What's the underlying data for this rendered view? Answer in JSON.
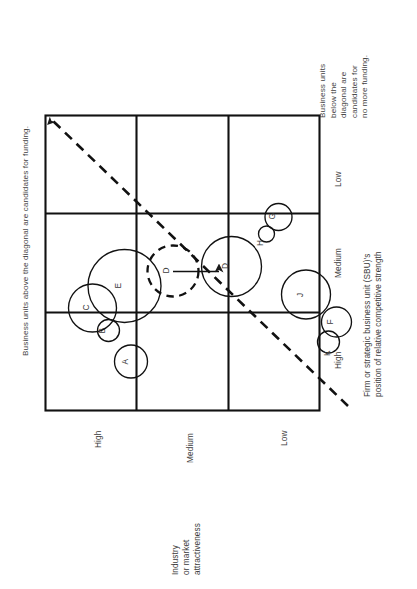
{
  "figure": {
    "type": "ge-mckinsey-matrix",
    "rotation_deg": -90,
    "notes": {
      "above_diagonal": "Business units above the diagonal are candidates for funding.",
      "below_diagonal": "Business units\nbelow the\ndiagonal are\ncandidates for\nno more funding."
    },
    "y_axis": {
      "title": "Industry\nor market\nattractiveness",
      "ticks": [
        "High",
        "Medium",
        "Low"
      ]
    },
    "x_axis": {
      "title": "Firm or strategic business unit (SBU)'s\nposition of relative competitive strength",
      "ticks": [
        "High",
        "Medium",
        "Low"
      ]
    }
  },
  "chart_data": {
    "type": "scatter",
    "title": "",
    "subtitle": "",
    "xlabel": "Firm or strategic business unit (SBU)'s position of relative competitive strength",
    "ylabel": "Industry or market attractiveness",
    "xticks": [
      "High",
      "Medium",
      "Low"
    ],
    "yticks": [
      "High",
      "Medium",
      "Low"
    ],
    "xlim": [
      0,
      3
    ],
    "ylim": [
      0,
      3
    ],
    "grid": true,
    "grid_cells": 9,
    "legend": "none",
    "annotations": [
      "Business units above the diagonal are candidates for funding.",
      "Business units below the diagonal are candidates for no more funding."
    ],
    "diagonal": {
      "style": "dashed",
      "from": [
        0,
        0
      ],
      "to": [
        3,
        3
      ],
      "arrow_at": "top-left"
    },
    "points": [
      {
        "label": "A",
        "x": 0.42,
        "y": 2.26,
        "r": 0.3,
        "style": "solid"
      },
      {
        "label": "B",
        "x": 0.66,
        "y": 1.77,
        "r": 0.2,
        "style": "solid"
      },
      {
        "label": "C",
        "x": 0.78,
        "y": 1.42,
        "r": 0.44,
        "style": "solid"
      },
      {
        "label": "E",
        "x": 1.12,
        "y": 1.7,
        "r": 0.63,
        "style": "solid"
      },
      {
        "label": "D",
        "x": 1.3,
        "y": 1.22,
        "r": 0.45,
        "style": "dashed"
      },
      {
        "label": "D",
        "x": 2.18,
        "y": 1.18,
        "r": 0.52,
        "style": "solid"
      },
      {
        "label": "G",
        "x": 1.62,
        "y": 2.31,
        "r": 0.24,
        "style": "solid"
      },
      {
        "label": "H",
        "x": 1.46,
        "y": 2.47,
        "r": 0.14,
        "style": "solid"
      },
      {
        "label": "J",
        "x": 0.86,
        "y": 2.46,
        "r": 0.43,
        "style": "solid"
      },
      {
        "label": "F",
        "x": 0.5,
        "y": 2.62,
        "r": 0.26,
        "style": "solid"
      },
      {
        "label": "K",
        "x": 0.56,
        "y": 2.82,
        "r": 0.19,
        "style": "solid"
      }
    ],
    "arrow": {
      "from_label": "D",
      "to_label": "D",
      "description": "movement arrow from dashed D to solid D"
    }
  },
  "bubbles": [
    {
      "id": "A",
      "label": "A",
      "cx": 131.0,
      "cy": 361.5,
      "r": 16.5,
      "dash": false,
      "lx": 127.5,
      "ly": 364.5
    },
    {
      "id": "B",
      "label": "B",
      "cx": 108.5,
      "cy": 330.5,
      "r": 11.0,
      "dash": false,
      "lx": 105.0,
      "ly": 333.5
    },
    {
      "id": "C",
      "label": "C",
      "cx": 92.5,
      "cy": 308.0,
      "r": 24.0,
      "dash": false,
      "lx": 88.5,
      "ly": 310.5
    },
    {
      "id": "E",
      "label": "E",
      "cx": 124.5,
      "cy": 286.0,
      "r": 36.5,
      "dash": false,
      "lx": 120.5,
      "ly": 288.5
    },
    {
      "id": "D_dash",
      "label": "D",
      "cx": 173.0,
      "cy": 271.0,
      "r": 25.5,
      "dash": true,
      "lx": 169.0,
      "ly": 273.5
    },
    {
      "id": "D_solid",
      "label": "D",
      "cx": 231.5,
      "cy": 266.5,
      "r": 30.0,
      "dash": false,
      "lx": 227.5,
      "ly": 269.0
    },
    {
      "id": "J",
      "label": "J",
      "cx": 306.0,
      "cy": 294.5,
      "r": 24.5,
      "dash": false,
      "lx": 302.5,
      "ly": 297.0
    },
    {
      "id": "G",
      "label": "G",
      "cx": 278.5,
      "cy": 217.0,
      "r": 13.5,
      "dash": false,
      "lx": 275.0,
      "ly": 219.5
    },
    {
      "id": "H",
      "label": "H",
      "cx": 266.5,
      "cy": 234.0,
      "r": 8.0,
      "dash": false,
      "lx": 263.0,
      "ly": 246.0
    },
    {
      "id": "F",
      "label": "F",
      "cx": 336.5,
      "cy": 322.0,
      "r": 15.0,
      "dash": false,
      "lx": 333.0,
      "ly": 324.5
    },
    {
      "id": "K",
      "label": "K",
      "cx": 328.5,
      "cy": 342.0,
      "r": 11.0,
      "dash": false,
      "lx": 330.0,
      "ly": 356.0
    }
  ]
}
